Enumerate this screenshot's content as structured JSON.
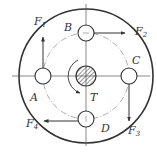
{
  "diagram": {
    "type": "bolted-flange-coupling",
    "colors": {
      "line": "#333333",
      "background": "#ffffff"
    },
    "torque": {
      "label": "T",
      "direction": "counterclockwise-arrow"
    },
    "bolts": [
      {
        "id": "A",
        "label": "A",
        "force": "F",
        "force_sub": "1",
        "force_direction": "up"
      },
      {
        "id": "B",
        "label": "B",
        "force": "F",
        "force_sub": "2",
        "force_direction": "right"
      },
      {
        "id": "C",
        "label": "C",
        "force": "F",
        "force_sub": "3",
        "force_direction": "down"
      },
      {
        "id": "D",
        "label": "D",
        "force": "F",
        "force_sub": "4",
        "force_direction": "left"
      }
    ]
  }
}
